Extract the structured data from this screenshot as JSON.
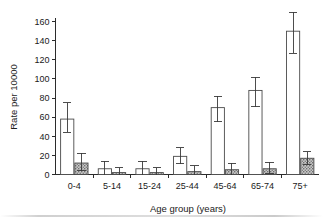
{
  "chart_data": {
    "type": "bar",
    "title": "",
    "xlabel": "Age group (years)",
    "ylabel": "Rate per 10000",
    "categories": [
      "0-4",
      "5-14",
      "15-24",
      "25-44",
      "45-64",
      "65-74",
      "75+"
    ],
    "ylim": [
      0,
      168
    ],
    "yticks": [
      0,
      20,
      40,
      60,
      80,
      100,
      120,
      140,
      160
    ],
    "ytick_labels": [
      "0",
      "20",
      "40",
      "60",
      "80",
      "100",
      "120",
      "140",
      "160"
    ],
    "grid": false,
    "legend": "none",
    "error_bars": "95% confidence interval (T-caps)",
    "series": [
      {
        "name": "open-bars",
        "style": "white fill, dark outline",
        "color": "#ffffff",
        "edge_color": "#4a4a4a",
        "values": [
          58,
          6,
          6,
          19,
          70,
          88,
          150
        ],
        "err_low": [
          44,
          0,
          0,
          11,
          55,
          71,
          127
        ],
        "err_high": [
          75,
          14,
          14,
          28,
          82,
          102,
          170
        ]
      },
      {
        "name": "shaded-bars",
        "style": "gray stippled fill, dark outline",
        "color": "#9d9d9d",
        "edge_color": "#4a4a4a",
        "values": [
          12,
          2,
          2,
          3,
          5,
          6,
          17
        ],
        "err_low": [
          4,
          0,
          0,
          0,
          0,
          1,
          10
        ],
        "err_high": [
          22,
          7,
          7,
          9,
          12,
          13,
          24
        ]
      }
    ]
  },
  "axes": {
    "y_axis_label": "Rate per 10000",
    "x_axis_label": "Age group (years)"
  }
}
